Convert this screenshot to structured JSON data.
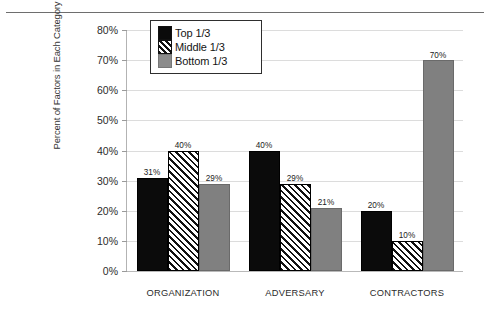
{
  "chart_data": {
    "type": "bar",
    "title": "",
    "xlabel": "",
    "ylabel": "Percent of Factors in Each Category",
    "ylim": [
      0,
      80
    ],
    "ytick_step": 10,
    "ytick_labels": [
      "0%",
      "10%",
      "20%",
      "30%",
      "40%",
      "50%",
      "60%",
      "70%",
      "80%"
    ],
    "ytick_values": [
      0,
      10,
      20,
      30,
      40,
      50,
      60,
      70,
      80
    ],
    "grid": true,
    "legend_position": "top-left-inside",
    "categories": [
      "ORGANIZATION",
      "ADVERSARY",
      "CONTRACTORS"
    ],
    "series": [
      {
        "name": "Top 1/3",
        "color": "#0b0b0b",
        "fill": "solid-black",
        "values": [
          31,
          40,
          20
        ],
        "labels": [
          "31%",
          "40%",
          "20%"
        ]
      },
      {
        "name": "Middle 1/3",
        "color": "#ffffff",
        "fill": "diagonal-hatch",
        "values": [
          40,
          29,
          10
        ],
        "labels": [
          "40%",
          "29%",
          "10%"
        ]
      },
      {
        "name": "Bottom 1/3",
        "color": "#808080",
        "fill": "solid-gray",
        "values": [
          29,
          21,
          70
        ],
        "labels": [
          "29%",
          "21%",
          "70%"
        ]
      }
    ]
  },
  "legend": {
    "items": [
      {
        "label": "Top 1/3",
        "swatch": "solid-black-swatch"
      },
      {
        "label": "Middle 1/3",
        "swatch": "diagonal-hatch-swatch"
      },
      {
        "label": "Bottom 1/3",
        "swatch": "solid-gray-swatch"
      }
    ]
  }
}
